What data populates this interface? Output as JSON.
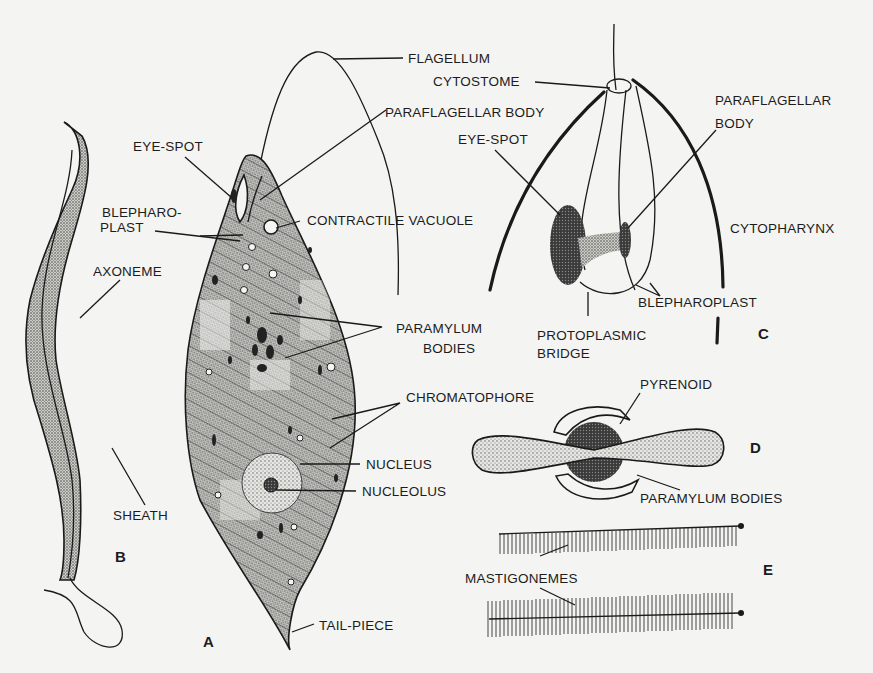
{
  "figures": {
    "A": {
      "letter": "A",
      "caption": "Euglena – whole cell"
    },
    "B": {
      "letter": "B",
      "caption": "Flagellum structure"
    },
    "C": {
      "letter": "C",
      "caption": "Anterior end (enlarged)"
    },
    "D": {
      "letter": "D",
      "caption": "Pyrenoid with paramylum"
    },
    "E": {
      "letter": "E",
      "caption": "Mastigonemes"
    }
  },
  "labels": {
    "flagellum": "FLAGELLUM",
    "cytostome": "CYTOSTOME",
    "paraflagellar_body_a": "PARAFLAGELLAR BODY",
    "paraflagellar_body_c_1": "PARAFLAGELLAR",
    "paraflagellar_body_c_2": "BODY",
    "eye_spot_a": "EYE-SPOT",
    "eye_spot_c": "EYE-SPOT",
    "blepharoplast_a_1": "BLEPHARO-",
    "blepharoplast_a_2": "PLAST",
    "contractile_vacuole": "CONTRACTILE VACUOLE",
    "cytopharynx": "CYTOPHARYNX",
    "axoneme": "AXONEME",
    "blepharoplast_c": "BLEPHAROPLAST",
    "paramylum_bodies_a_1": "PARAMYLUM",
    "paramylum_bodies_a_2": "BODIES",
    "protoplasmic_bridge_1": "PROTOPLASMIC",
    "protoplasmic_bridge_2": "BRIDGE",
    "chromatophore": "CHROMATOPHORE",
    "pyrenoid": "PYRENOID",
    "nucleus": "NUCLEUS",
    "nucleolus": "NUCLEOLUS",
    "paramylum_bodies_d": "PARAMYLUM BODIES",
    "sheath": "SHEATH",
    "mastigonemes": "MASTIGONEMES",
    "tail_piece": "TAIL-PIECE"
  },
  "colors": {
    "background": "#f4f4f2",
    "ink": "#1a1a1a",
    "stipple_light": "#b9b9b4",
    "stipple_dark": "#3a3a3a"
  }
}
